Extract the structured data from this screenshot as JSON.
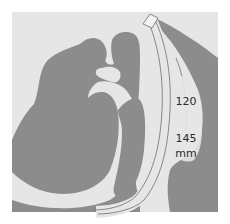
{
  "figure": {
    "colors": {
      "background": "#ffffff",
      "frame": "#e6e6e6",
      "tissue": "#8c8c8c",
      "airway": "#e6e6e6",
      "device_outline": "#6e6e6e"
    }
  },
  "measurement": {
    "min_value": "120",
    "max_value": "145",
    "unit": "mm"
  }
}
